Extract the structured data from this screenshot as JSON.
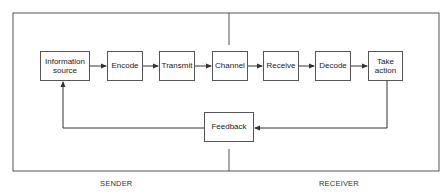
{
  "diagram": {
    "type": "communication-process-flow",
    "zones": [
      {
        "id": "sender",
        "label": "SENDER"
      },
      {
        "id": "receiver",
        "label": "RECEIVER"
      }
    ],
    "nodes": [
      {
        "id": "information-source",
        "label": "Information source"
      },
      {
        "id": "encode",
        "label": "Encode"
      },
      {
        "id": "transmit",
        "label": "Transmit"
      },
      {
        "id": "channel",
        "label": "Channel"
      },
      {
        "id": "receive",
        "label": "Receive"
      },
      {
        "id": "decode",
        "label": "Decode"
      },
      {
        "id": "take-action",
        "label": "Take action"
      },
      {
        "id": "feedback",
        "label": "Feedback"
      }
    ],
    "edges": [
      {
        "from": "information-source",
        "to": "encode"
      },
      {
        "from": "encode",
        "to": "transmit"
      },
      {
        "from": "transmit",
        "to": "channel"
      },
      {
        "from": "channel",
        "to": "receive"
      },
      {
        "from": "receive",
        "to": "decode"
      },
      {
        "from": "decode",
        "to": "take-action"
      },
      {
        "from": "take-action",
        "to": "feedback"
      },
      {
        "from": "feedback",
        "to": "information-source"
      }
    ],
    "colors": {
      "line": "#444444",
      "box_border": "#555555",
      "background": "#ffffff"
    }
  }
}
